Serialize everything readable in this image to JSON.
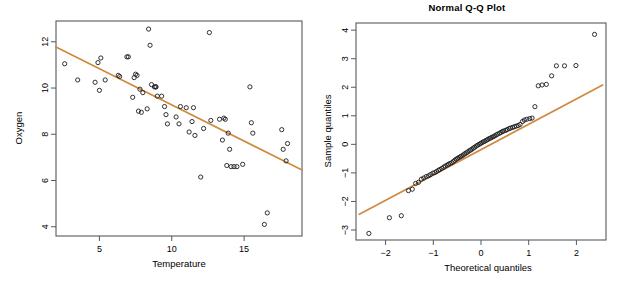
{
  "figure": {
    "background": "#ffffff",
    "panel_count": 2,
    "line_color": "#d2883f",
    "point_color": "#1c1c1c",
    "frame_color": "#555a5e"
  },
  "chart_data": [
    {
      "type": "scatter",
      "panel": "left",
      "title": "",
      "xlabel": "Temperature",
      "ylabel": "Oxygen",
      "xlim": [
        2.0,
        19.0
      ],
      "ylim": [
        3.6,
        12.9
      ],
      "xticks": [
        5,
        10,
        15
      ],
      "yticks": [
        4,
        6,
        8,
        10,
        12
      ],
      "xticklabels": [
        "5",
        "10",
        "15"
      ],
      "yticklabels": [
        "4",
        "6",
        "8",
        "10",
        "12"
      ],
      "grid": false,
      "legend": "none",
      "fit_line": {
        "label": "regression line",
        "color": "#d2883f",
        "x_start": 2.0,
        "y_start": 11.78,
        "x_end": 19.0,
        "y_end": 6.45,
        "slope": -0.3135,
        "intercept": 12.407
      },
      "x": [
        2.6,
        3.5,
        4.7,
        4.9,
        5.0,
        5.1,
        5.4,
        6.3,
        6.4,
        6.9,
        7.0,
        7.3,
        7.4,
        7.5,
        7.6,
        7.7,
        7.8,
        7.9,
        8.0,
        8.3,
        8.4,
        8.5,
        8.6,
        8.8,
        8.9,
        8.9,
        9.0,
        9.3,
        9.5,
        9.6,
        9.7,
        10.3,
        10.5,
        10.6,
        11.0,
        11.2,
        11.4,
        11.5,
        11.6,
        12.0,
        12.2,
        12.6,
        12.7,
        13.3,
        13.5,
        13.6,
        13.7,
        13.8,
        13.9,
        14.0,
        14.1,
        14.3,
        14.5,
        14.9,
        15.4,
        15.5,
        15.6,
        16.4,
        16.6,
        17.6,
        17.7,
        17.9,
        18.0
      ],
      "y": [
        11.05,
        10.35,
        10.25,
        11.1,
        9.9,
        11.3,
        10.35,
        10.55,
        10.5,
        11.35,
        11.35,
        9.6,
        10.45,
        10.6,
        10.55,
        9.0,
        9.95,
        8.95,
        9.8,
        9.1,
        12.55,
        11.85,
        10.15,
        10.05,
        10.05,
        10.05,
        9.65,
        9.65,
        9.2,
        8.85,
        8.45,
        8.75,
        8.45,
        9.2,
        9.15,
        8.1,
        8.55,
        9.15,
        7.95,
        6.15,
        8.25,
        12.4,
        8.6,
        8.65,
        7.75,
        8.7,
        8.65,
        6.65,
        8.05,
        7.35,
        6.6,
        6.6,
        6.6,
        6.7,
        10.05,
        8.5,
        8.05,
        4.1,
        4.6,
        8.2,
        7.35,
        6.85,
        7.6
      ]
    },
    {
      "type": "scatter",
      "panel": "right",
      "title": "Normal Q-Q Plot",
      "xlabel": "Theoretical quantiles",
      "ylabel": "Sample quantiles",
      "xlim": [
        -2.62,
        2.62
      ],
      "ylim": [
        -3.35,
        4.25
      ],
      "xticks": [
        -2,
        -1,
        0,
        1,
        2
      ],
      "yticks": [
        -3,
        -2,
        -1,
        0,
        1,
        2,
        3,
        4
      ],
      "xticklabels": [
        "−2",
        "−1",
        "0",
        "1",
        "2"
      ],
      "yticklabels": [
        "−3",
        "−2",
        "−1",
        "0",
        "1",
        "2",
        "3",
        "4"
      ],
      "grid": false,
      "legend": "none",
      "fit_line": {
        "label": "qq reference line",
        "color": "#d2883f",
        "x_start": -2.55,
        "y_start": -2.45,
        "x_end": 2.55,
        "y_end": 2.08,
        "slope": 0.888,
        "intercept": -0.185
      },
      "x": [
        -2.35,
        -1.92,
        -1.67,
        -1.52,
        -1.44,
        -1.37,
        -1.31,
        -1.25,
        -1.2,
        -1.15,
        -1.1,
        -1.06,
        -1.01,
        -0.97,
        -0.93,
        -0.89,
        -0.86,
        -0.82,
        -0.78,
        -0.75,
        -0.71,
        -0.68,
        -0.65,
        -0.61,
        -0.58,
        -0.55,
        -0.52,
        -0.49,
        -0.46,
        -0.43,
        -0.4,
        -0.37,
        -0.34,
        -0.31,
        -0.28,
        -0.25,
        -0.22,
        -0.19,
        -0.16,
        -0.13,
        -0.1,
        -0.07,
        -0.04,
        -0.01,
        0.02,
        0.05,
        0.08,
        0.11,
        0.14,
        0.17,
        0.2,
        0.23,
        0.26,
        0.29,
        0.32,
        0.35,
        0.39,
        0.42,
        0.45,
        0.48,
        0.52,
        0.55,
        0.59,
        0.62,
        0.66,
        0.7,
        0.74,
        0.78,
        0.82,
        0.87,
        0.91,
        0.96,
        1.02,
        1.07,
        1.13,
        1.2,
        1.28,
        1.37,
        1.48,
        1.58,
        1.75,
        1.99,
        2.38
      ],
      "y": [
        -3.12,
        -2.57,
        -2.5,
        -1.62,
        -1.57,
        -1.37,
        -1.33,
        -1.22,
        -1.18,
        -1.13,
        -1.1,
        -1.06,
        -1.01,
        -0.99,
        -0.95,
        -0.91,
        -0.88,
        -0.84,
        -0.8,
        -0.76,
        -0.73,
        -0.7,
        -0.67,
        -0.64,
        -0.6,
        -0.56,
        -0.52,
        -0.49,
        -0.46,
        -0.43,
        -0.4,
        -0.37,
        -0.33,
        -0.3,
        -0.27,
        -0.23,
        -0.2,
        -0.17,
        -0.13,
        -0.1,
        -0.06,
        -0.03,
        0.0,
        0.03,
        0.06,
        0.09,
        0.11,
        0.14,
        0.17,
        0.2,
        0.22,
        0.25,
        0.27,
        0.3,
        0.33,
        0.36,
        0.39,
        0.42,
        0.45,
        0.47,
        0.49,
        0.52,
        0.55,
        0.57,
        0.59,
        0.62,
        0.64,
        0.66,
        0.7,
        0.8,
        0.85,
        0.88,
        0.9,
        0.92,
        1.32,
        2.05,
        2.08,
        2.1,
        2.4,
        2.75,
        2.75,
        2.76,
        3.85
      ]
    }
  ]
}
